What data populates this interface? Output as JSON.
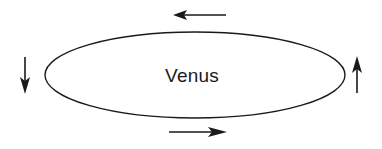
{
  "diagram": {
    "background_color": "#ffffff",
    "stroke_color": "#1a1a1a",
    "planet": {
      "label": "Venus",
      "shape": "ellipse",
      "center_x": 195,
      "center_y": 75,
      "radius_x": 150,
      "radius_y": 43
    },
    "label_position": {
      "x": 192,
      "y": 82
    },
    "arrows": [
      {
        "id": "top-arrow",
        "name": "top-arrow-left",
        "direction": "left",
        "glyph": "←",
        "start_x": 226,
        "start_y": 15,
        "end_x": 175,
        "end_y": 15
      },
      {
        "id": "bottom-arrow",
        "name": "bottom-arrow-right",
        "direction": "right",
        "glyph": "→",
        "start_x": 169,
        "start_y": 132,
        "end_x": 226,
        "end_y": 132
      },
      {
        "id": "left-arrow",
        "name": "left-arrow-down",
        "direction": "down",
        "glyph": "↓",
        "start_x": 25,
        "start_y": 57,
        "end_x": 25,
        "end_y": 93
      },
      {
        "id": "right-arrow",
        "name": "right-arrow-up",
        "direction": "up",
        "glyph": "↑",
        "start_x": 357,
        "start_y": 93,
        "end_x": 357,
        "end_y": 57
      }
    ]
  }
}
